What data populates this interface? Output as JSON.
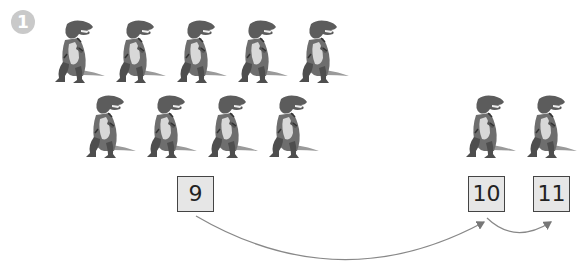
{
  "exercise": {
    "number_badge": "1",
    "description": "Counting on: 9 dinosaurs in a group, then 2 more dinosaurs counted on as 10 and 11",
    "group_count": 9,
    "extra_count": 2,
    "colors": {
      "badge": "#c9c9c9",
      "box_fill": "#e6e6e6",
      "box_border": "#444444",
      "arrow": "#777777"
    }
  },
  "dinos": {
    "group": [
      {
        "x": 47,
        "y": 18
      },
      {
        "x": 108,
        "y": 18
      },
      {
        "x": 169,
        "y": 18
      },
      {
        "x": 230,
        "y": 18
      },
      {
        "x": 291,
        "y": 18
      },
      {
        "x": 78,
        "y": 93
      },
      {
        "x": 139,
        "y": 93
      },
      {
        "x": 200,
        "y": 93
      },
      {
        "x": 261,
        "y": 93
      }
    ],
    "extra": [
      {
        "x": 458,
        "y": 93
      },
      {
        "x": 519,
        "y": 93
      }
    ]
  },
  "boxes": [
    {
      "label": "9",
      "x": 177,
      "y": 176
    },
    {
      "label": "10",
      "x": 468,
      "y": 176
    },
    {
      "label": "11",
      "x": 533,
      "y": 176
    }
  ]
}
